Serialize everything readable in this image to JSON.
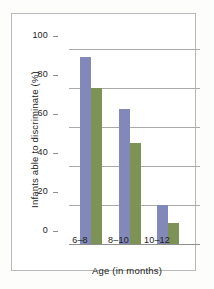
{
  "chart_data": {
    "type": "bar",
    "title": "",
    "xlabel": "Age (in months)",
    "ylabel": "Infants able to discriminate (%)",
    "categories": [
      "6–8",
      "8–10",
      "10–12"
    ],
    "series": [
      {
        "name": "series-1",
        "color": "#8289b8",
        "values": [
          96,
          69,
          20
        ]
      },
      {
        "name": "series-2",
        "color": "#7d9356",
        "values": [
          80,
          52,
          11
        ]
      }
    ],
    "ylim": [
      0,
      100
    ],
    "yticks": [
      0,
      20,
      40,
      60,
      80,
      100
    ],
    "ytick_labels": [
      "0",
      "20",
      "40",
      "60",
      "80",
      "100"
    ],
    "grid": "horizontal",
    "legend": "none",
    "axis_color": "#8f8f8f",
    "grid_color": "#a9a9a9",
    "frame_color": "#b9b9b9",
    "background": "#ffffff"
  }
}
